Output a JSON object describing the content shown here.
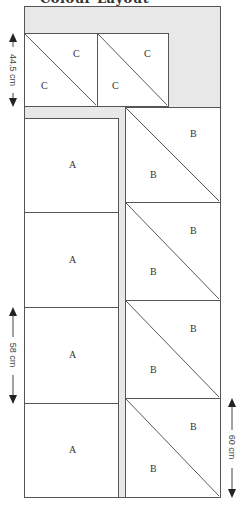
{
  "title": "Colour Layout",
  "colors": {
    "border": "#555555",
    "sashing": "#e8e8e8",
    "block": "#ffffff",
    "text": "#333333"
  },
  "blocks": {
    "c": [
      {
        "label_top": "C",
        "label_bottom": "C"
      },
      {
        "label_top": "C",
        "label_bottom": "C"
      }
    ],
    "a": [
      {
        "label": "A"
      },
      {
        "label": "A"
      },
      {
        "label": "A"
      },
      {
        "label": "A"
      }
    ],
    "b": [
      {
        "label_top": "B",
        "label_bottom": "B"
      },
      {
        "label_top": "B",
        "label_bottom": "B"
      },
      {
        "label_top": "B",
        "label_bottom": "B"
      },
      {
        "label_top": "B",
        "label_bottom": "B"
      }
    ]
  },
  "dimensions": {
    "c_height": "44.5 cm",
    "a_height": "58 cm",
    "b_height": "60 cm"
  }
}
